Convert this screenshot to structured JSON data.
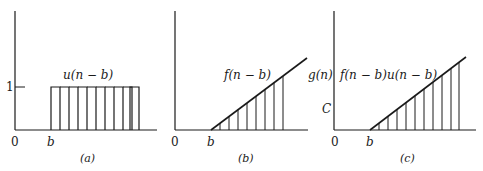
{
  "figure": {
    "panels": [
      {
        "id": "a",
        "caption": "(a)",
        "curve_label": "u(n − b)",
        "origin_label": "0",
        "shift_label": "b",
        "y_tick_label": "1",
        "pulse_count": 8
      },
      {
        "id": "b",
        "caption": "(b)",
        "curve_label": "f(n − b)",
        "origin_label": "0",
        "shift_label": "b",
        "sample_count": 8
      },
      {
        "id": "c",
        "caption": "(c)",
        "curve_label": "f(n − b)u(n − b)",
        "y_axis_label": "g(n)",
        "y_tick_label": "C",
        "origin_label": "0",
        "shift_label": "b",
        "sample_count": 10
      }
    ],
    "colors": {
      "ink": "#1a1a1a",
      "background": "#ffffff"
    }
  }
}
